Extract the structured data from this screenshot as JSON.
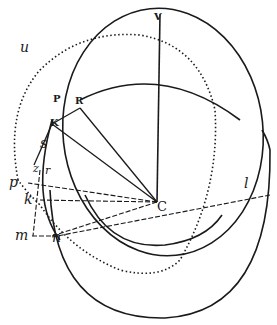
{
  "figure": {
    "labels": {
      "V": "V",
      "P": "P",
      "R": "R",
      "K": "K",
      "C": "C",
      "u": "u",
      "s": "s",
      "z": "z",
      "r": "r",
      "p": "p",
      "k": "k",
      "m": "m",
      "n": "n",
      "l": "l"
    },
    "colors": {
      "ink": "#1a1a1a",
      "background": "#ffffff"
    }
  }
}
